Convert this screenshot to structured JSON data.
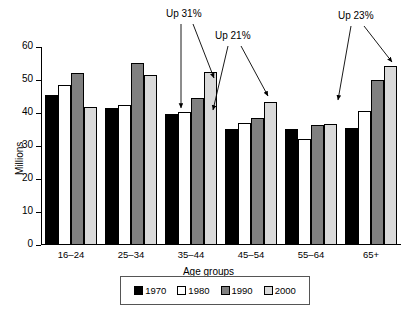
{
  "chart_data": {
    "type": "bar",
    "title": "",
    "xlabel": "Age groups",
    "ylabel": "Millions",
    "ylim": [
      0,
      60
    ],
    "yticks": [
      0,
      10,
      20,
      30,
      40,
      50,
      60
    ],
    "grid": false,
    "legend_position": "bottom",
    "categories": [
      "16–24",
      "25–34",
      "35–44",
      "45–54",
      "55–64",
      "65+"
    ],
    "series": [
      {
        "name": "1970",
        "color": "#000000",
        "values": [
          45.5,
          41.5,
          39.7,
          35.2,
          35.3,
          35.5
        ]
      },
      {
        "name": "1980",
        "color": "#ffffff",
        "values": [
          48.5,
          42.3,
          40.4,
          37.0,
          32.1,
          40.5
        ]
      },
      {
        "name": "1990",
        "color": "#808080",
        "values": [
          52.2,
          55.1,
          44.4,
          38.6,
          36.4,
          50.0
        ]
      },
      {
        "name": "2000",
        "color": "#d9d9d9",
        "values": [
          41.8,
          51.4,
          52.5,
          43.4,
          36.6,
          54.2
        ]
      }
    ],
    "annotations": [
      {
        "text": "Up 31%",
        "x": 186,
        "y": 14
      },
      {
        "text": "Up 21%",
        "x": 235,
        "y": 36
      },
      {
        "text": "Up 23%",
        "x": 358,
        "y": 16
      }
    ]
  },
  "legend": {
    "items": [
      {
        "label": "1970",
        "swatch": "#000000"
      },
      {
        "label": "1980",
        "swatch": "#ffffff"
      },
      {
        "label": "1990",
        "swatch": "#808080"
      },
      {
        "label": "2000",
        "swatch": "#d9d9d9"
      }
    ]
  }
}
